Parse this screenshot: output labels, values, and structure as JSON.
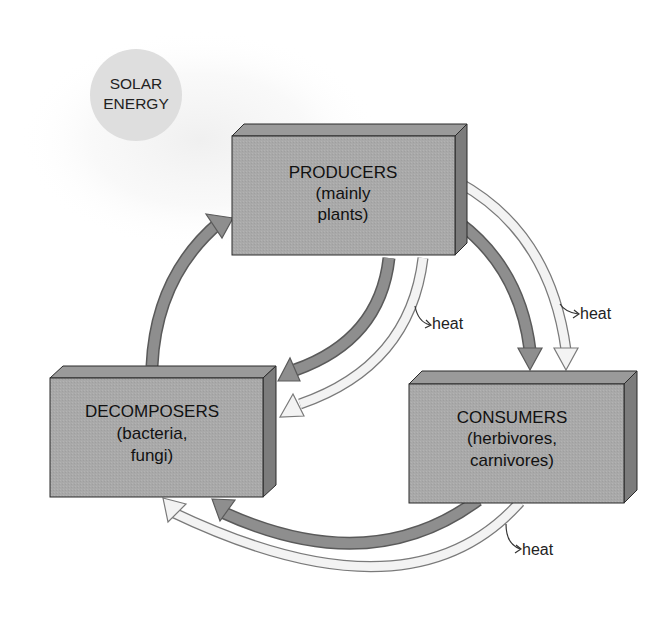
{
  "colors": {
    "background": "#ffffff",
    "sun_fill": "#dedede",
    "sun_halo": "#f4f4f4",
    "box_front": "#a9a9a9",
    "box_top": "#9a9a9a",
    "box_side": "#7c7c7c",
    "box_outline": "#2a2a2a",
    "nutrient_arrow": "#8e8e8e",
    "energy_arrow_fill": "#f3f3f3",
    "energy_arrow_outline": "#7a7a7a",
    "text": "#111111"
  },
  "sun": {
    "line1": "SOLAR",
    "line2": "ENERGY"
  },
  "nodes": {
    "producers": {
      "title": "PRODUCERS",
      "line2": "(mainly",
      "line3": "plants)"
    },
    "decomposers": {
      "title": "DECOMPOSERS",
      "line2": "(bacteria,",
      "line3": "fungi)"
    },
    "consumers": {
      "title": "CONSUMERS",
      "line2": "(herbivores,",
      "line3": "carnivores)"
    }
  },
  "heat_labels": {
    "producers_to_decomposers": "heat",
    "producers_to_consumers": "heat",
    "consumers_to_decomposers": "heat"
  },
  "flows": [
    {
      "from": "decomposers",
      "to": "producers",
      "kind": "nutrients"
    },
    {
      "from": "producers",
      "to": "decomposers",
      "kind": "nutrients"
    },
    {
      "from": "producers",
      "to": "decomposers",
      "kind": "energy"
    },
    {
      "from": "producers",
      "to": "consumers",
      "kind": "nutrients"
    },
    {
      "from": "producers",
      "to": "consumers",
      "kind": "energy"
    },
    {
      "from": "consumers",
      "to": "decomposers",
      "kind": "nutrients"
    },
    {
      "from": "consumers",
      "to": "decomposers",
      "kind": "energy"
    }
  ]
}
